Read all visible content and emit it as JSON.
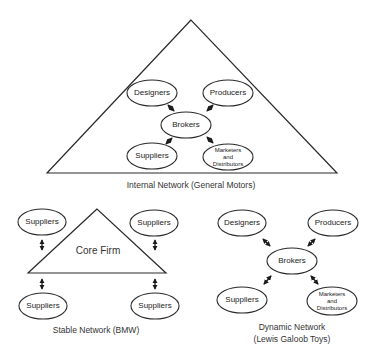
{
  "internal_network": {
    "caption": "Internal Network (General Motors)",
    "nodes": {
      "designers": "Designers",
      "producers": "Producers",
      "brokers": "Brokers",
      "suppliers": "Suppliers",
      "marketers_line1": "Marketers",
      "marketers_line2": "and",
      "marketers_line3": "Distributors"
    }
  },
  "stable_network": {
    "caption": "Stable Network (BMW)",
    "core": "Core Firm",
    "nodes": {
      "top_left": "Suppliers",
      "top_right": "Suppliers",
      "bottom_left": "Suppliers",
      "bottom_right": "Suppliers"
    }
  },
  "dynamic_network": {
    "caption_line1": "Dynamic Network",
    "caption_line2": "(Lewis Galoob Toys)",
    "nodes": {
      "designers": "Designers",
      "producers": "Producers",
      "brokers": "Brokers",
      "suppliers": "Suppliers",
      "marketers_line1": "Marketers",
      "marketers_line2": "and",
      "marketers_line3": "Distributors"
    }
  }
}
